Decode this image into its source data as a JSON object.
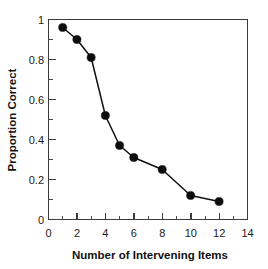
{
  "figure": {
    "background_color": "#ffffff",
    "width": 268,
    "height": 269
  },
  "chart_data": {
    "type": "line",
    "title": "",
    "subtitle": "",
    "xlabel": "Number of Intervening Items",
    "ylabel": "Proportion Correct",
    "x": [
      1,
      2,
      3,
      4,
      5,
      6,
      8,
      10,
      12
    ],
    "values": [
      0.96,
      0.9,
      0.81,
      0.52,
      0.37,
      0.31,
      0.25,
      0.12,
      0.09
    ],
    "series": [
      {
        "name": "Proportion Correct",
        "x": [
          1,
          2,
          3,
          4,
          5,
          6,
          8,
          10,
          12
        ],
        "values": [
          0.96,
          0.9,
          0.81,
          0.52,
          0.37,
          0.31,
          0.25,
          0.12,
          0.09
        ]
      }
    ],
    "xlim": [
      0,
      14
    ],
    "ylim": [
      0,
      1
    ],
    "xticks": [
      0,
      2,
      4,
      6,
      8,
      10,
      12,
      14
    ],
    "xtick_labels": [
      "0",
      "2",
      "4",
      "6",
      "8",
      "10",
      "12",
      "14"
    ],
    "xminor_ticks": [
      1,
      3,
      5,
      7,
      9,
      11,
      13
    ],
    "yticks": [
      0,
      0.2,
      0.4,
      0.6,
      0.8,
      1
    ],
    "ytick_labels": [
      "0",
      "0.2",
      "0.4",
      "0.6",
      "0.8",
      "1"
    ],
    "yminor_ticks": [
      0.1,
      0.3,
      0.5,
      0.7,
      0.9
    ],
    "grid": false,
    "legend": null,
    "legend_position": "none",
    "marker": "filled-circle",
    "marker_color": "#0d0d0d",
    "line_color": "#111111",
    "frame": "box",
    "frame_color": "#3b3b3b"
  }
}
